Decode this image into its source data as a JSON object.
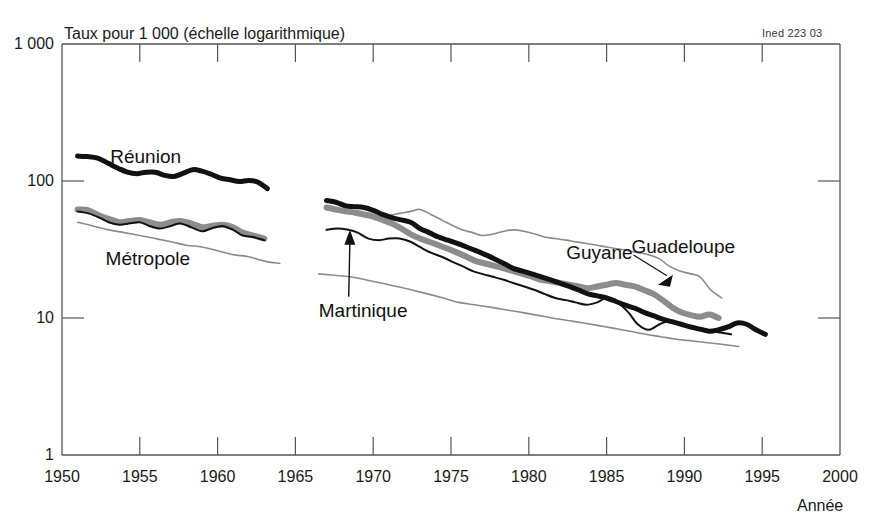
{
  "chart": {
    "axis_title": "Taux pour 1 000 (échelle logarithmique)",
    "credit": "Ined 223 03",
    "xaxis_label": "Année"
  },
  "chart_data": {
    "type": "line",
    "title": "Taux pour 1 000 (échelle logarithmique)",
    "subtitle": "Ined 223 03",
    "xlabel": "Année",
    "ylabel": "Taux pour 1 000 (échelle logarithmique)",
    "yscale": "log",
    "ylim": [
      1,
      1000
    ],
    "xlim": [
      1950,
      2000
    ],
    "ytick_labels": [
      "1 000",
      "100",
      "10",
      "1"
    ],
    "ytick_values": [
      1000,
      100,
      10,
      1
    ],
    "xtick_labels": [
      "1950",
      "1955",
      "1960",
      "1965",
      "1970",
      "1975",
      "1980",
      "1985",
      "1990",
      "1995",
      "2000"
    ],
    "xtick_values": [
      1950,
      1955,
      1960,
      1965,
      1970,
      1975,
      1980,
      1985,
      1990,
      1995,
      2000
    ],
    "grid": false,
    "legend": "inline-annotations",
    "annotations": [
      {
        "text": "Réunion",
        "x": 1953.1,
        "y": 150,
        "style": "plain"
      },
      {
        "text": "Métropole",
        "x": 1952.8,
        "y": 27,
        "style": "plain"
      },
      {
        "text": "Martinique",
        "x": 1966.5,
        "y": 11.3,
        "style": "arrow",
        "points_to": {
          "x": 1968.5,
          "y": 44
        }
      },
      {
        "text": "Guyane",
        "x": 1982.4,
        "y": 30,
        "style": "plain"
      },
      {
        "text": "Guadeloupe",
        "x": 1986.6,
        "y": 33,
        "style": "leader",
        "points_to": {
          "x": 1988.3,
          "y": 17.5
        }
      }
    ],
    "series": [
      {
        "name": "Réunion",
        "style": "thick-black",
        "color": "#111111",
        "width": 5,
        "segments": [
          {
            "x": [
              1951,
              1951.6,
              1952.3,
              1953,
              1953.6,
              1954.2,
              1954.8,
              1955.4,
              1956,
              1956.6,
              1957.2,
              1957.8,
              1958.4,
              1959,
              1959.6,
              1960.2,
              1960.8,
              1961.4,
              1962,
              1962.6,
              1963.2
            ],
            "y": [
              152,
              151,
              147,
              134,
              124,
              116,
              113,
              116,
              116,
              110,
              108,
              114,
              121,
              118,
              112,
              105,
              102,
              99,
              101,
              98,
              88
            ]
          },
          {
            "x": [
              1967,
              1967.6,
              1968.2,
              1968.8,
              1969.4,
              1970,
              1970.6,
              1971.2,
              1971.8,
              1972.4,
              1973,
              1973.6,
              1974.2,
              1974.8,
              1975.4,
              1976,
              1976.6,
              1977.2,
              1977.8,
              1978.4,
              1979,
              1979.6,
              1980.2,
              1980.8,
              1981.4,
              1982,
              1982.6,
              1983.2,
              1983.8,
              1984.4,
              1985,
              1985.6,
              1986.2,
              1986.8,
              1987.4,
              1988,
              1988.6,
              1989.2,
              1989.8,
              1990.4,
              1991,
              1991.6,
              1992.2,
              1992.8,
              1993.4,
              1994,
              1994.6,
              1995.2
            ],
            "y": [
              72,
              70,
              66,
              65,
              64,
              61,
              57,
              54,
              52,
              50,
              45,
              42,
              39,
              37,
              35,
              33,
              31,
              29,
              27,
              25,
              23,
              22,
              21,
              20,
              19,
              18,
              17,
              16,
              15,
              14.5,
              14,
              13.2,
              12.4,
              11.8,
              11,
              10.4,
              9.8,
              9.4,
              9,
              8.6,
              8.3,
              8,
              8.2,
              8.6,
              9.2,
              9,
              8.2,
              7.6
            ]
          }
        ]
      },
      {
        "name": "Guadeloupe",
        "style": "thick-gray",
        "color": "#8c8c8c",
        "width": 6,
        "segments": [
          {
            "x": [
              1951,
              1951.7,
              1952.4,
              1953,
              1953.7,
              1954.3,
              1955,
              1955.6,
              1956.3,
              1957,
              1957.6,
              1958.3,
              1959,
              1959.6,
              1960.3,
              1961,
              1961.6,
              1962.3,
              1963
            ],
            "y": [
              62,
              61,
              56,
              53,
              50,
              51,
              52,
              50,
              48,
              50,
              51,
              49,
              46,
              47,
              48,
              46,
              42,
              40,
              38
            ]
          },
          {
            "x": [
              1967,
              1967.6,
              1968.2,
              1968.8,
              1969.4,
              1970,
              1970.6,
              1971.2,
              1971.8,
              1972.4,
              1973,
              1973.6,
              1974.2,
              1974.8,
              1975.4,
              1976,
              1976.6,
              1977.2,
              1977.8,
              1978.4,
              1979,
              1979.6,
              1980.2,
              1980.8,
              1981.4,
              1982,
              1982.6,
              1983.2,
              1983.8,
              1984.4,
              1985,
              1985.6,
              1986.2,
              1986.8,
              1987.4,
              1988,
              1988.6,
              1989.2,
              1989.8,
              1990.4,
              1991,
              1991.6,
              1992.2
            ],
            "y": [
              64,
              62,
              60,
              59,
              57,
              55,
              52,
              49,
              45,
              41,
              38,
              36,
              34,
              32,
              30,
              28,
              26,
              25,
              24,
              23,
              22,
              21,
              20,
              19,
              18.5,
              18,
              17.5,
              17,
              16.5,
              17,
              17.5,
              18,
              17.5,
              17,
              16,
              15,
              13.5,
              12,
              11,
              10.5,
              10.2,
              10.6,
              10
            ]
          }
        ]
      },
      {
        "name": "Martinique",
        "style": "thin-black",
        "color": "#111111",
        "width": 2,
        "segments": [
          {
            "x": [
              1951,
              1951.7,
              1952.4,
              1953,
              1953.7,
              1954.3,
              1955,
              1955.6,
              1956.3,
              1957,
              1957.6,
              1958.3,
              1959,
              1959.6,
              1960.3,
              1961,
              1961.6,
              1962.3,
              1963
            ],
            "y": [
              60,
              58,
              54,
              50,
              48,
              49,
              50,
              47,
              45,
              47,
              49,
              46,
              43,
              45,
              47,
              44,
              40,
              39,
              37
            ]
          },
          {
            "x": [
              1967,
              1967.7,
              1968.4,
              1969,
              1969.7,
              1970.4,
              1971,
              1971.7,
              1972.4,
              1973,
              1973.7,
              1974.4,
              1975,
              1975.7,
              1976.4,
              1977,
              1977.7,
              1978.4,
              1979,
              1979.7,
              1980.4,
              1981,
              1981.7,
              1982.4,
              1983,
              1983.7,
              1984.4,
              1985,
              1985.7,
              1986.4,
              1987,
              1987.7,
              1988.4,
              1989,
              1989.7,
              1990.4,
              1991,
              1991.7,
              1992.4,
              1993
            ],
            "y": [
              44,
              45,
              44,
              42,
              38,
              37,
              38,
              38,
              36,
              33,
              30,
              28,
              26,
              24,
              22,
              21,
              20,
              19,
              18,
              17,
              16,
              15,
              14,
              13.5,
              13,
              12.5,
              13,
              14,
              13,
              11,
              9,
              8.2,
              9,
              9.5,
              9.2,
              8.6,
              8.2,
              8,
              7.8,
              7.6
            ]
          }
        ]
      },
      {
        "name": "Métropole",
        "style": "thin-gray",
        "color": "#8a8a8a",
        "width": 1.6,
        "segments": [
          {
            "x": [
              1951,
              1952,
              1953,
              1954,
              1955,
              1956,
              1957,
              1958,
              1959,
              1960,
              1961,
              1962,
              1963,
              1964
            ],
            "y": [
              50,
              47,
              44,
              42,
              40,
              38,
              36,
              34,
              33,
              31,
              29,
              28,
              26,
              25
            ]
          }
        ]
      },
      {
        "name": "Guyane",
        "style": "thin-gray",
        "color": "#8a8a8a",
        "width": 1.6,
        "segments": [
          {
            "x": [
              1967,
              1967.7,
              1968.4,
              1969,
              1969.7,
              1970.4,
              1971,
              1971.7,
              1972.4,
              1973,
              1973.7,
              1974.4,
              1975,
              1975.7,
              1976.4,
              1977,
              1977.7,
              1978.4,
              1979,
              1979.7,
              1980.4,
              1981,
              1981.7,
              1982.4,
              1983,
              1983.7,
              1984.4,
              1985,
              1985.7,
              1986.4,
              1987,
              1987.7,
              1988.4,
              1989,
              1989.7,
              1990.4,
              1991,
              1991.7,
              1992.4
            ],
            "y": [
              62,
              60,
              58,
              56,
              55,
              55,
              56,
              58,
              60,
              62,
              57,
              52,
              48,
              44,
              42,
              40,
              41,
              43,
              44,
              43,
              41,
              39,
              38,
              37,
              36,
              35,
              34,
              33,
              32,
              31,
              30,
              29,
              27,
              24,
              22,
              21,
              20,
              16,
              14
            ]
          }
        ]
      },
      {
        "name": "Métropole-right",
        "style": "thin-gray",
        "color": "#8a8a8a",
        "width": 1.6,
        "segments": [
          {
            "x": [
              1966.5,
              1967.5,
              1968.5,
              1969.5,
              1970.5,
              1971.5,
              1972.5,
              1973.5,
              1974.5,
              1975.5,
              1976.5,
              1977.5,
              1978.5,
              1979.5,
              1980.5,
              1981.5,
              1982.5,
              1983.5,
              1984.5,
              1985.5,
              1986.5,
              1987.5,
              1988.5,
              1989.5,
              1990.5,
              1991.5,
              1992.5,
              1993.5
            ],
            "y": [
              21,
              20.5,
              20,
              19,
              18,
              17,
              16,
              15,
              14,
              13,
              12.5,
              12,
              11.5,
              11,
              10.5,
              10,
              9.6,
              9.2,
              8.8,
              8.4,
              8,
              7.6,
              7.3,
              7,
              6.8,
              6.6,
              6.4,
              6.2
            ]
          }
        ]
      }
    ]
  }
}
